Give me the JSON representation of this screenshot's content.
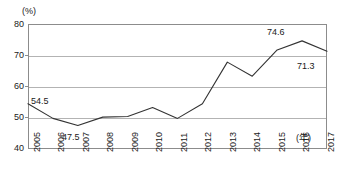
{
  "chart_data": {
    "type": "line",
    "title": "",
    "xlabel": "(年)",
    "ylabel": "(%)",
    "x": [
      2005,
      2006,
      2007,
      2008,
      2009,
      2010,
      2011,
      2012,
      2013,
      2014,
      2015,
      2016,
      2017
    ],
    "categories": [
      "2005",
      "2006",
      "2007",
      "2008",
      "2009",
      "2010",
      "2011",
      "2012",
      "2013",
      "2014",
      "2015",
      "2016",
      "2017"
    ],
    "values": [
      54.5,
      49.8,
      47.5,
      50.2,
      50.4,
      53.3,
      49.8,
      54.5,
      67.8,
      63.3,
      71.7,
      74.6,
      71.3
    ],
    "series": [
      {
        "name": "",
        "values": [
          54.5,
          49.8,
          47.5,
          50.2,
          50.4,
          53.3,
          49.8,
          54.5,
          67.8,
          63.3,
          71.7,
          74.6,
          71.3
        ]
      }
    ],
    "ylim": [
      40,
      80
    ],
    "yticks": [
      40,
      50,
      60,
      70,
      80
    ],
    "ytick_labels": [
      "40",
      "50",
      "60",
      "70",
      "80"
    ],
    "grid": "horizontal",
    "legend": "none",
    "line_color": "#333333",
    "gridline_color": "#b3b3b3",
    "frame_color": "#8c8c8c",
    "markers": "none",
    "annotations": [
      {
        "year": "2005",
        "value": "54.5",
        "position": "above-right"
      },
      {
        "year": "2007",
        "value": "47.5",
        "position": "below"
      },
      {
        "year": "2016",
        "value": "74.6",
        "position": "above"
      },
      {
        "year": "2017",
        "value": "71.3",
        "position": "below-left"
      }
    ]
  },
  "axes": {
    "y_unit_label": "(%)",
    "x_unit_label": "(年)",
    "y_tick_40": "40",
    "y_tick_50": "50",
    "y_tick_60": "60",
    "y_tick_70": "70",
    "y_tick_80": "80"
  },
  "x_labels": {
    "y2005": "2005",
    "y2006": "2006",
    "y2007": "2007",
    "y2008": "2008",
    "y2009": "2009",
    "y2010": "2010",
    "y2011": "2011",
    "y2012": "2012",
    "y2013": "2013",
    "y2014": "2014",
    "y2015": "2015",
    "y2016": "2016",
    "y2017": "2017"
  },
  "point_labels": {
    "first": "54.5",
    "minimum": "47.5",
    "maximum": "74.6",
    "last": "71.3"
  }
}
